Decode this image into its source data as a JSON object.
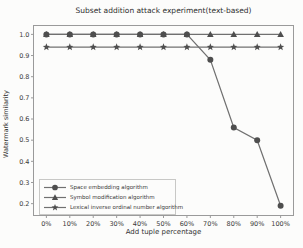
{
  "chart_data": {
    "type": "line",
    "title": "Subset addition attack experiment(text-based)",
    "xlabel": "Add tuple percentage",
    "ylabel": "Watermark similarity",
    "x_tick_labels": [
      "0%",
      "10%",
      "20%",
      "30%",
      "40%",
      "50%",
      "60%",
      "70%",
      "80%",
      "90%",
      "100%"
    ],
    "y_ticks": [
      0.2,
      0.3,
      0.4,
      0.5,
      0.6,
      0.7,
      0.8,
      0.9,
      1.0
    ],
    "y_tick_labels": [
      "0.2",
      "0.3",
      "0.4",
      "0.5",
      "0.6",
      "0.7",
      "0.8",
      "0.9",
      "1.0"
    ],
    "ylim": [
      0.144,
      1.042
    ],
    "grid": false,
    "legend_position": "lower-left",
    "series": [
      {
        "name": "Space embedding algorithm",
        "marker": "circle",
        "values": [
          1.0,
          1.0,
          1.0,
          1.0,
          1.0,
          1.0,
          1.0,
          0.88,
          0.56,
          0.5,
          0.19
        ]
      },
      {
        "name": "Symbol modification algorithm",
        "marker": "triangle",
        "values": [
          1.0,
          1.0,
          1.0,
          1.0,
          1.0,
          1.0,
          1.0,
          1.0,
          1.0,
          1.0,
          1.0
        ]
      },
      {
        "name": "Lexical inverse ordinal number algorithm",
        "marker": "star",
        "values": [
          0.94,
          0.94,
          0.94,
          0.94,
          0.94,
          0.94,
          0.94,
          0.94,
          0.94,
          0.94,
          0.94
        ]
      }
    ],
    "colors": {
      "line": "#707070",
      "marker": "#4e4e4e",
      "axis": "#9a9a9a",
      "text": "#3a3a3a",
      "background": "#fcfcfb"
    }
  }
}
